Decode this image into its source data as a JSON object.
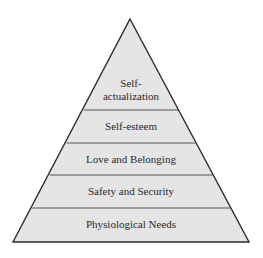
{
  "diagram": {
    "type": "pyramid",
    "colors": {
      "fill": "#e5e5e5",
      "stroke": "#2b2b2b",
      "divider": "#555555",
      "text": "#2a2a2a"
    },
    "levels": [
      {
        "label_line1": "Self-",
        "label_line2": "actualization"
      },
      {
        "label": "Self-esteem"
      },
      {
        "label": "Love and Belonging"
      },
      {
        "label": "Safety and Security"
      },
      {
        "label": "Physiological Needs"
      }
    ]
  }
}
